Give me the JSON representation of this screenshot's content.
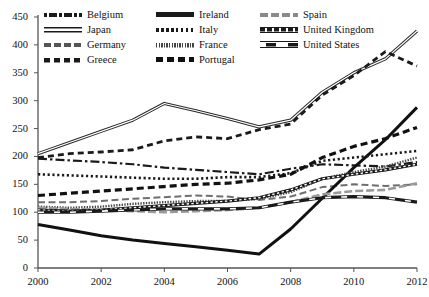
{
  "chart_data": {
    "type": "line",
    "title": "",
    "xlabel": "",
    "ylabel": "",
    "xlim": [
      2000,
      2012
    ],
    "ylim": [
      0,
      450
    ],
    "grid": false,
    "legend_position": "top",
    "x": [
      2000,
      2001,
      2002,
      2003,
      2004,
      2005,
      2006,
      2007,
      2008,
      2009,
      2010,
      2011,
      2012
    ],
    "yticks": [
      0,
      50,
      100,
      150,
      200,
      250,
      300,
      350,
      400,
      450
    ],
    "xticks": [
      2000,
      2002,
      2004,
      2006,
      2008,
      2010,
      2012
    ],
    "series": [
      {
        "name": "Belgium",
        "style": "dash-dot",
        "values": [
          196,
          193,
          190,
          186,
          180,
          176,
          172,
          168,
          178,
          186,
          184,
          182,
          190
        ]
      },
      {
        "name": "Japan",
        "style": "solid-double",
        "values": [
          205,
          225,
          245,
          265,
          295,
          282,
          268,
          253,
          265,
          315,
          350,
          375,
          425
        ]
      },
      {
        "name": "Germany",
        "style": "dash-gray",
        "values": [
          118,
          118,
          120,
          124,
          127,
          130,
          128,
          122,
          128,
          145,
          150,
          147,
          150
        ]
      },
      {
        "name": "Greece",
        "style": "dash-square",
        "values": [
          198,
          205,
          208,
          212,
          228,
          235,
          232,
          248,
          258,
          310,
          345,
          388,
          362
        ]
      },
      {
        "name": "Ireland",
        "style": "solid-thick",
        "values": [
          78,
          68,
          58,
          50,
          44,
          38,
          32,
          25,
          70,
          125,
          180,
          230,
          288
        ]
      },
      {
        "name": "Italy",
        "style": "dotted",
        "values": [
          168,
          166,
          164,
          162,
          160,
          160,
          163,
          163,
          170,
          192,
          198,
          204,
          210
        ]
      },
      {
        "name": "France",
        "style": "fine-hatch",
        "values": [
          110,
          108,
          110,
          115,
          118,
          120,
          120,
          124,
          136,
          160,
          172,
          182,
          198
        ]
      },
      {
        "name": "Portugal",
        "style": "dash-bold",
        "values": [
          130,
          134,
          138,
          142,
          146,
          150,
          152,
          158,
          168,
          198,
          218,
          232,
          252
        ]
      },
      {
        "name": "Spain",
        "style": "gray-dash",
        "values": [
          108,
          106,
          104,
          102,
          100,
          102,
          104,
          108,
          118,
          132,
          138,
          140,
          152
        ]
      },
      {
        "name": "United Kingdom",
        "style": "uk-banded",
        "values": [
          104,
          102,
          104,
          108,
          112,
          116,
          120,
          126,
          140,
          160,
          168,
          176,
          186
        ]
      },
      {
        "name": "United States",
        "style": "us-banded",
        "values": [
          100,
          100,
          102,
          104,
          106,
          106,
          106,
          108,
          118,
          126,
          128,
          126,
          118
        ]
      }
    ]
  },
  "legend": {
    "columns": [
      [
        {
          "label": "Belgium",
          "swatch": "sw-dashdot"
        },
        {
          "label": "Japan",
          "swatch": "sw-solid2"
        },
        {
          "label": "Germany",
          "swatch": "sw-dash-med"
        },
        {
          "label": "Greece",
          "swatch": "sw-dash-sq"
        }
      ],
      [
        {
          "label": "Ireland",
          "swatch": "sw-solid-thick"
        },
        {
          "label": "Italy",
          "swatch": "sw-dot"
        },
        {
          "label": "France",
          "swatch": "sw-fine"
        },
        {
          "label": "Portugal",
          "swatch": "sw-dash-bold"
        }
      ],
      [
        {
          "label": "Spain",
          "swatch": "sw-gray-dash"
        },
        {
          "label": "United Kingdom",
          "swatch": "sw-ukdash"
        },
        {
          "label": "United States",
          "swatch": "sw-usdash"
        }
      ]
    ]
  },
  "axes": {
    "y_labels": [
      "450",
      "400",
      "350",
      "300",
      "250",
      "200",
      "150",
      "100",
      "50",
      "0"
    ],
    "x_labels": [
      "2000",
      "2002",
      "2004",
      "2006",
      "2008",
      "2010",
      "2012"
    ]
  },
  "colors": {
    "ink": "#1a1a1a",
    "gray": "#8a8a8a",
    "background": "#ffffff"
  }
}
